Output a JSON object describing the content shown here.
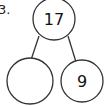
{
  "problem": {
    "label": "3."
  },
  "number_bond": {
    "whole": "17",
    "part_left": "",
    "part_right": "9"
  },
  "colors": {
    "stroke": "#333333",
    "text": "#111111",
    "background": "#ffffff"
  }
}
